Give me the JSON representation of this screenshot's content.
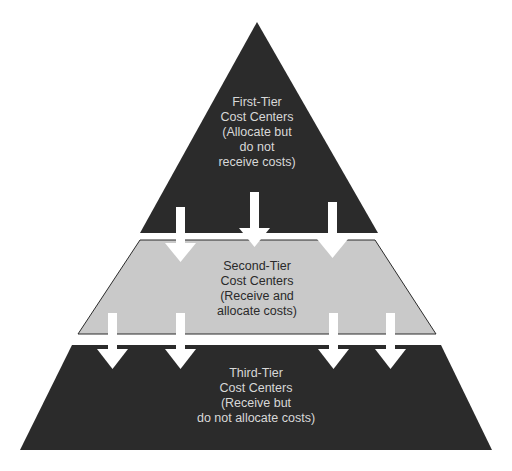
{
  "colors": {
    "dark_tier": "#2b2b2b",
    "middle_tier": "#c9c9c9",
    "arrow": "#ffffff",
    "background": "#ffffff"
  },
  "tiers": [
    {
      "name": "first-tier",
      "lines": [
        "First-Tier",
        "Cost Centers",
        "(Allocate but",
        "do not",
        "receive costs)"
      ]
    },
    {
      "name": "second-tier",
      "lines": [
        "Second-Tier",
        "Cost Centers",
        "(Receive and",
        "allocate costs)"
      ]
    },
    {
      "name": "third-tier",
      "lines": [
        "Third-Tier",
        "Cost Centers",
        "(Receive but",
        "do not allocate costs)"
      ]
    }
  ],
  "arrows": {
    "first_to_second": 3,
    "second_to_third": 4
  }
}
